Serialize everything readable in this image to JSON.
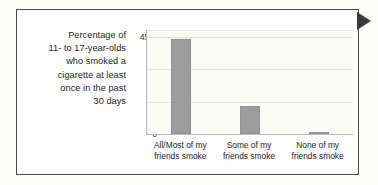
{
  "caption": {
    "lines": [
      "Percentage of",
      "11- to 17-year-olds",
      "who smoked a",
      "cigarette at least",
      "once in the past",
      "30 days"
    ],
    "full_text": "Percentage of 11- to 17-year-olds who smoked a cigarette at least once in the past 30 days"
  },
  "marker": {
    "icon": "triangle-right-icon",
    "color": "#3b3b3d"
  },
  "colors": {
    "bar": "#9c9c9c",
    "grid": "#e2e2e0",
    "axis": "#b9b9b7",
    "frame": "#4b4b4d",
    "plot_background": "#fafaf8",
    "text": "#1d1d1f"
  },
  "chart_data": {
    "type": "bar",
    "title": "",
    "subtitle": "",
    "xlabel": "",
    "ylabel": "",
    "categories": [
      "All/Most of my friends smoke",
      "Some of my friends smoke",
      "None of my friends smoke"
    ],
    "category_lines": [
      [
        "All/Most of my",
        "friends smoke"
      ],
      [
        "Some of my",
        "friends smoke"
      ],
      [
        "None of my",
        "friends smoke"
      ]
    ],
    "values": [
      44,
      13,
      1
    ],
    "ylim": [
      0,
      48
    ],
    "yticks": [
      0,
      15,
      30,
      45
    ],
    "ytick_labels": [
      "0",
      "15",
      "30",
      "45%"
    ],
    "grid": true,
    "legend": false
  }
}
